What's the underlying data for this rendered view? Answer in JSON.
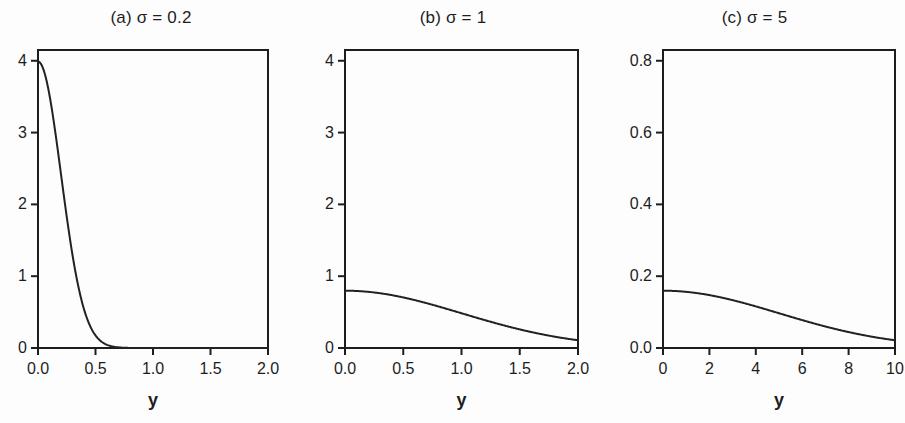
{
  "figure": {
    "background": "#fdfdfd",
    "line_color": "#222222",
    "axis_color": "#1d1d1d"
  },
  "chart_data": [
    {
      "type": "line",
      "title": "(a) σ = 0.2",
      "xlabel": "y",
      "ylabel": "",
      "xlim": [
        0,
        2
      ],
      "ylim": [
        0,
        4.15
      ],
      "grid": false,
      "legend": "none",
      "xticks": [
        "0.0",
        "0.5",
        "1.0",
        "1.5",
        "2.0"
      ],
      "xtick_values": [
        0,
        0.5,
        1,
        1.5,
        2
      ],
      "yticks": [
        "0",
        "1",
        "2",
        "3",
        "4"
      ],
      "ytick_values": [
        0,
        1,
        2,
        3,
        4
      ],
      "sigma": 0.2,
      "series": [
        {
          "name": "half-normal density",
          "x": [
            0,
            0.05,
            0.1,
            0.15,
            0.2,
            0.25,
            0.3,
            0.35,
            0.4,
            0.45,
            0.5,
            0.55,
            0.6,
            0.65,
            0.7,
            0.8,
            0.9,
            1.0,
            1.2,
            1.4,
            1.6,
            1.8,
            2.0
          ],
          "values": [
            3.989,
            3.867,
            3.521,
            3.027,
            2.42,
            1.813,
            1.27,
            0.832,
            0.511,
            0.294,
            0.158,
            0.08,
            0.037,
            0.017,
            0.007,
            0.001,
            0.0,
            0.0,
            0.0,
            0.0,
            0.0,
            0.0,
            0.0
          ]
        }
      ]
    },
    {
      "type": "line",
      "title": "(b) σ = 1",
      "xlabel": "y",
      "ylabel": "",
      "xlim": [
        0,
        2
      ],
      "ylim": [
        0,
        4.15
      ],
      "grid": false,
      "legend": "none",
      "xticks": [
        "0.0",
        "0.5",
        "1.0",
        "1.5",
        "2.0"
      ],
      "xtick_values": [
        0,
        0.5,
        1,
        1.5,
        2
      ],
      "yticks": [
        "0",
        "1",
        "2",
        "3",
        "4"
      ],
      "ytick_values": [
        0,
        1,
        2,
        3,
        4
      ],
      "sigma": 1,
      "series": [
        {
          "name": "half-normal density",
          "x": [
            0,
            0.2,
            0.4,
            0.6,
            0.8,
            1.0,
            1.2,
            1.4,
            1.6,
            1.8,
            2.0
          ],
          "values": [
            0.798,
            0.782,
            0.736,
            0.666,
            0.579,
            0.484,
            0.389,
            0.299,
            0.222,
            0.158,
            0.108
          ]
        }
      ]
    },
    {
      "type": "line",
      "title": "(c) σ = 5",
      "xlabel": "y",
      "ylabel": "",
      "xlim": [
        0,
        10
      ],
      "ylim": [
        0,
        0.83
      ],
      "grid": false,
      "legend": "none",
      "xticks": [
        "0",
        "2",
        "4",
        "6",
        "8",
        "10"
      ],
      "xtick_values": [
        0,
        2,
        4,
        6,
        8,
        10
      ],
      "yticks": [
        "0.0",
        "0.2",
        "0.4",
        "0.6",
        "0.8"
      ],
      "ytick_values": [
        0,
        0.2,
        0.4,
        0.6,
        0.8
      ],
      "sigma": 5,
      "series": [
        {
          "name": "half-normal density",
          "x": [
            0,
            1,
            2,
            3,
            4,
            5,
            6,
            7,
            8,
            9,
            10
          ],
          "values": [
            0.1596,
            0.1564,
            0.1472,
            0.1331,
            0.1157,
            0.0968,
            0.0779,
            0.0604,
            0.045,
            0.0323,
            0.0216
          ]
        }
      ]
    }
  ]
}
